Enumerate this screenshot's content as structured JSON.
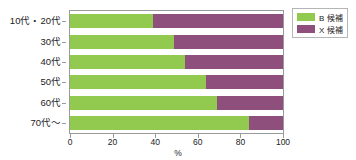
{
  "chart_data": {
    "type": "bar",
    "orientation": "horizontal",
    "stacked": true,
    "normalized_percent": true,
    "title": "",
    "subtitle": "",
    "xlabel": "%",
    "ylabel": "",
    "xlim": [
      0,
      100
    ],
    "xticks": [
      0,
      20,
      40,
      60,
      80,
      100
    ],
    "xtick_labels": [
      "0",
      "20",
      "40",
      "60",
      "80",
      "100"
    ],
    "grid": false,
    "legend_position": "top-right",
    "categories": [
      "10代・20代",
      "30代",
      "40代",
      "50代",
      "60代",
      "70代〜"
    ],
    "series": [
      {
        "name": "B 候補",
        "color": "#92c94f",
        "values": [
          39,
          49,
          54,
          64,
          69,
          84
        ]
      },
      {
        "name": "X 候補",
        "color": "#8e4f7d",
        "values": [
          61,
          51,
          46,
          36,
          31,
          16
        ]
      }
    ],
    "annotations": []
  },
  "legend": {
    "items": [
      {
        "label": "B 候補",
        "color": "#92c94f"
      },
      {
        "label": "X 候補",
        "color": "#8e4f7d"
      }
    ]
  },
  "axis": {
    "x_title": "%"
  },
  "colors": {
    "series_a": "#92c94f",
    "series_b": "#8e4f7d",
    "axis_line": "#9a9a9a",
    "text": "#222222",
    "background": "#ffffff"
  }
}
